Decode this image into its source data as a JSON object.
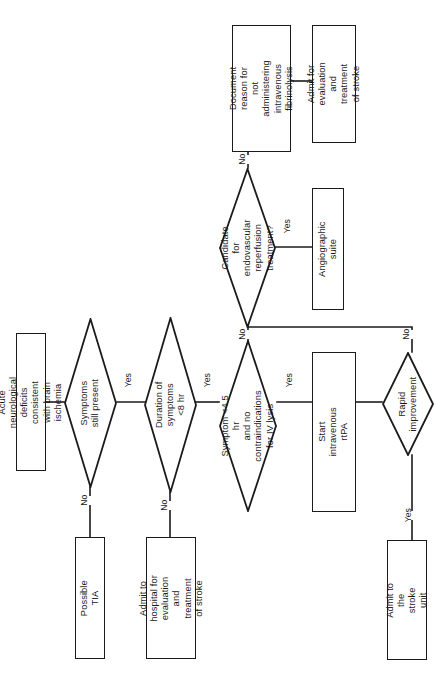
{
  "diagram": {
    "orientation": "rotated-90",
    "stroke_color": "#1b1b1b",
    "fill_color": "#ffffff",
    "nodes": [
      {
        "id": "start",
        "type": "process",
        "label": "Acute neurological deficits\nconsistent with brain ischemia"
      },
      {
        "id": "sx_present",
        "type": "decision",
        "label": "Symptoms\nstill present"
      },
      {
        "id": "possible_tia",
        "type": "process",
        "label": "Possible TIA"
      },
      {
        "id": "dur_8hr",
        "type": "decision",
        "label": "Duration of\nsymptoms <8 hr"
      },
      {
        "id": "admit_hosp",
        "type": "process",
        "label": "Admit to hospital for\nevaluation and\ntreatment of stroke"
      },
      {
        "id": "sx_45hr",
        "type": "decision",
        "label": "Symptom <4.5 hr\nand no contraindications\nfor IV lysis"
      },
      {
        "id": "start_rtpa",
        "type": "process",
        "label": "Start intravenous rtPA"
      },
      {
        "id": "rapid_improve",
        "type": "decision",
        "label": "Rapid\nimprovement"
      },
      {
        "id": "admit_unit",
        "type": "process",
        "label": "Admit to the\nstroke unit"
      },
      {
        "id": "endovascular",
        "type": "decision",
        "label": "Candidate for\nendovascular reperfusion\ntreatment?"
      },
      {
        "id": "angio_suite",
        "type": "process",
        "label": "Angiographic suite"
      },
      {
        "id": "document",
        "type": "process",
        "label": "Document reason for\nnot administering\nintravenous fibrinolysis"
      },
      {
        "id": "admit_eval",
        "type": "process",
        "label": "Admit for evaluation\nand treatment of stroke"
      }
    ],
    "edges": [
      {
        "from": "start",
        "to": "sx_present",
        "label": ""
      },
      {
        "from": "sx_present",
        "to": "possible_tia",
        "label": "No"
      },
      {
        "from": "sx_present",
        "to": "dur_8hr",
        "label": "Yes"
      },
      {
        "from": "dur_8hr",
        "to": "admit_hosp",
        "label": "No"
      },
      {
        "from": "dur_8hr",
        "to": "sx_45hr",
        "label": "Yes"
      },
      {
        "from": "sx_45hr",
        "to": "start_rtpa",
        "label": "Yes"
      },
      {
        "from": "sx_45hr",
        "to": "endovascular",
        "label": "No"
      },
      {
        "from": "start_rtpa",
        "to": "rapid_improve",
        "label": ""
      },
      {
        "from": "rapid_improve",
        "to": "admit_unit",
        "label": "Yes"
      },
      {
        "from": "rapid_improve",
        "to": "endovascular",
        "label": "No"
      },
      {
        "from": "endovascular",
        "to": "angio_suite",
        "label": "Yes"
      },
      {
        "from": "endovascular",
        "to": "document",
        "label": "No"
      },
      {
        "from": "document",
        "to": "admit_eval",
        "label": ""
      }
    ],
    "edge_labels": {
      "tia_no": "No",
      "sx_yes": "Yes",
      "dur_no": "No",
      "dur_yes": "Yes",
      "lysis_yes": "Yes",
      "lysis_no": "No",
      "rapid_yes": "Yes",
      "rapid_no": "No",
      "endo_yes": "Yes",
      "endo_no": "No"
    }
  }
}
